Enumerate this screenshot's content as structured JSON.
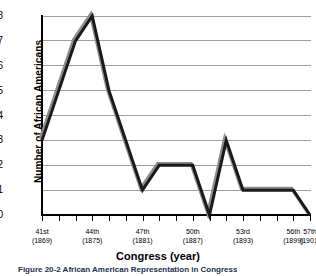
{
  "chart_data": {
    "type": "line",
    "title": "African American Representation in Congress",
    "xlabel": "Congress (year)",
    "ylabel": "Number of African Americans",
    "ylim": [
      0,
      8
    ],
    "xlim": [
      41,
      57
    ],
    "grid": true,
    "legend": "none",
    "y_ticks": [
      8,
      7,
      6,
      5,
      4,
      3,
      2,
      1,
      0
    ],
    "x": [
      41,
      42,
      43,
      44,
      45,
      46,
      47,
      48,
      49,
      50,
      51,
      52,
      53,
      54,
      55,
      56,
      57
    ],
    "categories": [
      "41st",
      "42nd",
      "43rd",
      "44th",
      "45th",
      "46th",
      "47th",
      "48th",
      "49th",
      "50th",
      "51st",
      "52nd",
      "53rd",
      "54th",
      "55th",
      "56th",
      "57th"
    ],
    "values": [
      3,
      5,
      7,
      8,
      5,
      3,
      1,
      2,
      2,
      2,
      0,
      3,
      1,
      1,
      1,
      1,
      0
    ],
    "series": [
      {
        "name": "Number of African Americans",
        "values": [
          3,
          5,
          7,
          8,
          5,
          3,
          1,
          2,
          2,
          2,
          0,
          3,
          1,
          1,
          1,
          1,
          0
        ],
        "color": "#1a1a1a",
        "shadow_color": "#8c8c8c"
      }
    ],
    "labeled_x_ticks": [
      {
        "index": 0,
        "congress": "41st",
        "year": "(1869)"
      },
      {
        "index": 3,
        "congress": "44th",
        "year": "(1875)"
      },
      {
        "index": 6,
        "congress": "47th",
        "year": "(1881)"
      },
      {
        "index": 9,
        "congress": "50th",
        "year": "(1887)"
      },
      {
        "index": 12,
        "congress": "53rd",
        "year": "(1893)"
      },
      {
        "index": 15,
        "congress": "56th",
        "year": "(1899)"
      },
      {
        "index": 16,
        "congress": "57th",
        "year": "(1901)"
      }
    ]
  },
  "caption": {
    "text": "Figure 20-2  African American Representation in Congress"
  },
  "colors": {
    "line": "#1a1a1a",
    "line_shadow": "#8c8c8c",
    "grid": "#9d9d9d",
    "axis": "#000000",
    "caption": "#1a2f4a",
    "background": "#ffffff"
  }
}
